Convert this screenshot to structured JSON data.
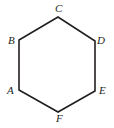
{
  "figure": {
    "type": "geometry-diagram",
    "shape_name": "hexagon",
    "background_color": "#ffffff",
    "stroke_color": "#231f20",
    "stroke_width": 1.6,
    "fill_color": "none",
    "canvas": {
      "width": 114,
      "height": 128
    },
    "vertices": [
      {
        "id": "A",
        "label": "A",
        "x": 19,
        "y": 90,
        "label_x": 7,
        "label_y": 85
      },
      {
        "id": "B",
        "label": "B",
        "x": 19,
        "y": 40,
        "label_x": 8,
        "label_y": 35
      },
      {
        "id": "C",
        "label": "C",
        "x": 58,
        "y": 17,
        "label_x": 55,
        "label_y": 3
      },
      {
        "id": "D",
        "label": "D",
        "x": 95,
        "y": 41,
        "label_x": 97,
        "label_y": 35
      },
      {
        "id": "E",
        "label": "E",
        "x": 95,
        "y": 91,
        "label_x": 99,
        "label_y": 85
      },
      {
        "id": "F",
        "label": "F",
        "x": 58,
        "y": 112,
        "label_x": 56,
        "label_y": 113
      }
    ],
    "edges": [
      {
        "from": "A",
        "to": "B"
      },
      {
        "from": "B",
        "to": "C"
      },
      {
        "from": "C",
        "to": "D"
      },
      {
        "from": "D",
        "to": "E"
      },
      {
        "from": "E",
        "to": "F"
      },
      {
        "from": "F",
        "to": "A"
      }
    ],
    "polygon_points": "19,90 19,40 58,17 95,41 95,91 58,112"
  }
}
